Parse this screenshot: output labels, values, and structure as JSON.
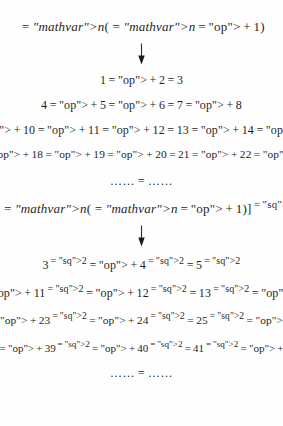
{
  "document": {
    "block_one": {
      "header": "n(n+1)",
      "arrow": "down-arrow",
      "rows": [
        "1+2=3",
        "4+5+6=7+8",
        "9+10+11+12=13+14+15",
        "16+17+18+19+20=21+22+23+24"
      ],
      "ellipsis_row": "……=……"
    },
    "block_two": {
      "header": "[2n(n+1)]²",
      "arrow": "down-arrow",
      "rows": [
        "3²+4²=5²",
        "10²+11²+12²=13²+14²",
        "21²+22²+23²+24²=25²+26²+27²",
        "36²+37²+38²+39²+40²=41²+42²+43²+44²"
      ],
      "ellipsis_row": "……=……"
    }
  },
  "chart_data": {
    "type": "table",
    "blocks": [
      {
        "generator": "n(n+1)",
        "identities": [
          {
            "n": 1,
            "left_terms": [
              1,
              2
            ],
            "right_terms": [
              3
            ]
          },
          {
            "n": 2,
            "left_terms": [
              4,
              5,
              6
            ],
            "right_terms": [
              7,
              8
            ]
          },
          {
            "n": 3,
            "left_terms": [
              9,
              10,
              11,
              12
            ],
            "right_terms": [
              13,
              14,
              15
            ]
          },
          {
            "n": 4,
            "left_terms": [
              16,
              17,
              18,
              19,
              20
            ],
            "right_terms": [
              21,
              22,
              23,
              24
            ]
          }
        ]
      },
      {
        "generator": "[2n(n+1)]²",
        "exponent": 2,
        "identities": [
          {
            "n": 1,
            "left_terms": [
              3,
              4
            ],
            "right_terms": [
              5
            ]
          },
          {
            "n": 2,
            "left_terms": [
              10,
              11,
              12
            ],
            "right_terms": [
              13,
              14
            ]
          },
          {
            "n": 3,
            "left_terms": [
              21,
              22,
              23,
              24
            ],
            "right_terms": [
              25,
              26,
              27
            ]
          },
          {
            "n": 4,
            "left_terms": [
              36,
              37,
              38,
              39,
              40
            ],
            "right_terms": [
              41,
              42,
              43,
              44
            ]
          }
        ]
      }
    ]
  },
  "style": {
    "text_color": "#1f1f1f",
    "background_color": "#fefefe"
  }
}
